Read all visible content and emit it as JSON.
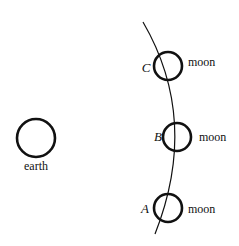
{
  "diagram": {
    "earth": {
      "label": "earth"
    },
    "orbit": {
      "name": "moon orbit path"
    },
    "moons": [
      {
        "letter": "C",
        "label": "moon"
      },
      {
        "letter": "B",
        "label": "moon"
      },
      {
        "letter": "A",
        "label": "moon"
      }
    ]
  }
}
